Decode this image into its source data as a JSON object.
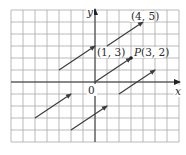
{
  "figure": {
    "grid": {
      "x_min": -7,
      "x_max": 7,
      "y_min": -5,
      "y_max": 6,
      "unit_px": 12,
      "origin_px": [
        95,
        82
      ]
    },
    "axes": {
      "x_label": "x",
      "y_label": "y",
      "origin_label": "0"
    },
    "vector": {
      "name": "P",
      "components": [
        3,
        2
      ]
    },
    "points": [
      {
        "id": "p13",
        "label": "(1, 3)",
        "x": 1,
        "y": 3
      },
      {
        "id": "p45",
        "label": "(4, 5)",
        "x": 4,
        "y": 5
      },
      {
        "id": "P",
        "label_name": "P",
        "label_coords": "(3, 2)",
        "x": 3,
        "y": 2
      }
    ],
    "arrows": [
      {
        "from": [
          0,
          0
        ],
        "to": [
          3,
          2
        ]
      },
      {
        "from": [
          1,
          3
        ],
        "to": [
          4,
          5
        ]
      },
      {
        "from": [
          -3,
          1
        ],
        "to": [
          0,
          3
        ]
      },
      {
        "from": [
          -5,
          -3
        ],
        "to": [
          -2,
          -1
        ]
      },
      {
        "from": [
          -2,
          -4
        ],
        "to": [
          1,
          -2
        ]
      },
      {
        "from": [
          2,
          -1
        ],
        "to": [
          5,
          1
        ]
      }
    ],
    "colors": {
      "grid": "#9a9a9a",
      "axis": "#333333",
      "arrow": "#3a3a3a",
      "text": "#2b2b2b"
    }
  }
}
